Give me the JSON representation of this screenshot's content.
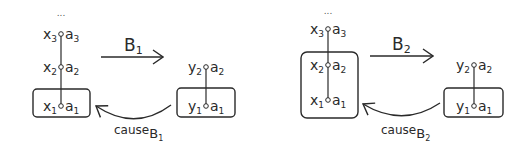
{
  "diagram": {
    "panels": [
      {
        "id": "panel-1",
        "ellipsis": "...",
        "left_chain": [
          {
            "var": "x",
            "var_sub": "3",
            "attr": "a",
            "attr_sub": "3"
          },
          {
            "var": "x",
            "var_sub": "2",
            "attr": "a",
            "attr_sub": "2"
          },
          {
            "var": "x",
            "var_sub": "1",
            "attr": "a",
            "attr_sub": "1"
          }
        ],
        "left_boxed": [
          "x1"
        ],
        "arrow_label": "B",
        "arrow_label_sub": "1",
        "right_chain": [
          {
            "var": "y",
            "var_sub": "2",
            "attr": "a",
            "attr_sub": "2"
          },
          {
            "var": "y",
            "var_sub": "1",
            "attr": "a",
            "attr_sub": "1"
          }
        ],
        "right_boxed": [
          "y1"
        ],
        "back_arrow_label": "cause",
        "back_arrow_label_sub": "B",
        "back_arrow_label_subsub": "1"
      },
      {
        "id": "panel-2",
        "ellipsis": "...",
        "left_chain": [
          {
            "var": "x",
            "var_sub": "3",
            "attr": "a",
            "attr_sub": "3"
          },
          {
            "var": "x",
            "var_sub": "2",
            "attr": "a",
            "attr_sub": "2"
          },
          {
            "var": "x",
            "var_sub": "1",
            "attr": "a",
            "attr_sub": "1"
          }
        ],
        "left_boxed": [
          "x2",
          "x1"
        ],
        "arrow_label": "B",
        "arrow_label_sub": "2",
        "right_chain": [
          {
            "var": "y",
            "var_sub": "2",
            "attr": "a",
            "attr_sub": "2"
          },
          {
            "var": "y",
            "var_sub": "1",
            "attr": "a",
            "attr_sub": "1"
          }
        ],
        "right_boxed": [
          "y1"
        ],
        "back_arrow_label": "cause",
        "back_arrow_label_sub": "B",
        "back_arrow_label_subsub": "2"
      }
    ],
    "colors": {
      "ink": "#2a2a2a",
      "background": "#ffffff"
    }
  }
}
